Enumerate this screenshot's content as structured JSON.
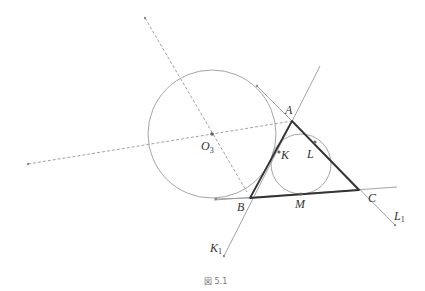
{
  "figure": {
    "caption": "図 5.1",
    "colors": {
      "thin_line": "#9a9a9a",
      "thick_line": "#333333",
      "dashed": "#8a8a8a",
      "point": "#666666",
      "label": "#333333"
    },
    "points": {
      "A": {
        "label": "A",
        "x": 292,
        "y": 121
      },
      "B": {
        "label": "B",
        "x": 250,
        "y": 198
      },
      "C": {
        "label": "C",
        "x": 359,
        "y": 190
      },
      "K": {
        "label": "K",
        "x": 279,
        "y": 152
      },
      "L": {
        "label": "L",
        "x": 315,
        "y": 142
      },
      "M": {
        "label": "M",
        "x": 301,
        "y": 194
      },
      "O3": {
        "label": "O",
        "sub": "3",
        "x": 212,
        "y": 134
      },
      "K1": {
        "label": "K",
        "sub": "1",
        "x": 224,
        "y": 256
      },
      "L1": {
        "label": "L",
        "sub": "1",
        "x": 395,
        "y": 225
      }
    },
    "circles": {
      "excircle_O3": {
        "cx": 212,
        "cy": 134,
        "r": 64
      },
      "incircle": {
        "cx": 301,
        "cy": 164,
        "r": 30
      }
    }
  }
}
